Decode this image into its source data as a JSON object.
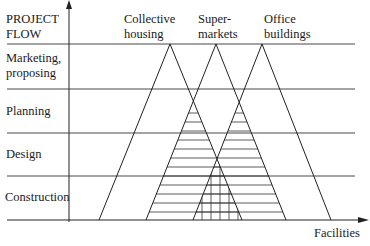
{
  "axis": {
    "y_title": [
      "PROJECT",
      "FLOW"
    ],
    "x_title": "Facilities"
  },
  "phases": [
    {
      "label": [
        "Marketing,",
        "proposing"
      ]
    },
    {
      "label": [
        "Planning"
      ]
    },
    {
      "label": [
        "Design"
      ]
    },
    {
      "label": [
        "Construction"
      ]
    }
  ],
  "facilities": [
    {
      "label": [
        "Collective",
        "housing"
      ]
    },
    {
      "label": [
        "Super-",
        "markets"
      ]
    },
    {
      "label": [
        "Office",
        "buildings"
      ]
    }
  ],
  "colors": {
    "line": "#222222",
    "background": "#ffffff"
  }
}
